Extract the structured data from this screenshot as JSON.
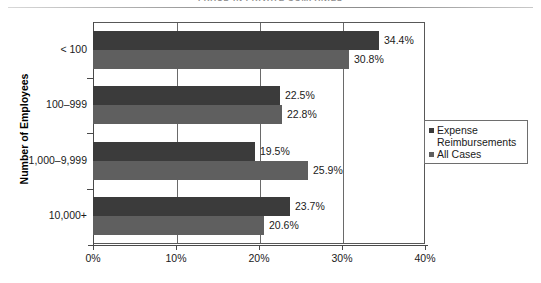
{
  "page": {
    "title": "FRAUD IN PRIVATE COMPANIES"
  },
  "legend": {
    "position": "right-middle",
    "entries": [
      {
        "label": "Expense Reimbursements",
        "color": "#3b3b3b"
      },
      {
        "label": "All Cases",
        "color": "#5f5f5f"
      }
    ]
  },
  "axes": {
    "y_title": "Number of Employees",
    "x_ticks": [
      "0%",
      "10%",
      "20%",
      "30%",
      "40%"
    ],
    "y_categories": [
      "< 100",
      "100–999",
      "1,000–9,999",
      "10,000+"
    ]
  },
  "chart_data": {
    "type": "bar",
    "orientation": "horizontal",
    "title": "FRAUD IN PRIVATE COMPANIES",
    "xlabel": "",
    "ylabel": "Number of Employees",
    "xlim": [
      0,
      40
    ],
    "xtick_values": [
      0,
      10,
      20,
      30,
      40
    ],
    "xtick_labels": [
      "0%",
      "10%",
      "20%",
      "30%",
      "40%"
    ],
    "grid": true,
    "legend_position": "right",
    "categories": [
      "< 100",
      "100–999",
      "1,000–9,999",
      "10,000+"
    ],
    "series": [
      {
        "name": "Expense Reimbursements",
        "color": "#3b3b3b",
        "values": [
          34.4,
          22.5,
          19.5,
          23.7
        ],
        "labels": [
          "34.4%",
          "22.5%",
          "19.5%",
          "23.7%"
        ]
      },
      {
        "name": "All Cases",
        "color": "#5f5f5f",
        "values": [
          30.8,
          22.8,
          25.9,
          20.6
        ],
        "labels": [
          "30.8%",
          "22.8%",
          "25.9%",
          "20.6%"
        ]
      }
    ]
  }
}
